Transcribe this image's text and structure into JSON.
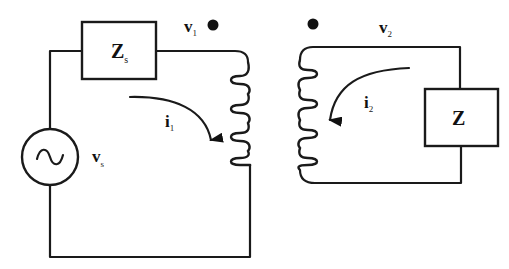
{
  "diagram": {
    "type": "transformer-circuit",
    "primary": {
      "source": {
        "label": "v",
        "subscript": "s",
        "symbol": "~"
      },
      "series_impedance": {
        "label": "Z",
        "subscript": "s"
      },
      "voltage": {
        "label": "v",
        "subscript": "1"
      },
      "current": {
        "label": "i",
        "subscript": "1"
      },
      "coil_turns": 5,
      "dot_marker": true
    },
    "secondary": {
      "load_impedance": {
        "label": "Z",
        "subscript": ""
      },
      "voltage": {
        "label": "v",
        "subscript": "2"
      },
      "current": {
        "label": "i",
        "subscript": "2"
      },
      "coil_turns": 5,
      "dot_marker": true
    },
    "colors": {
      "line": "#1a1a1a",
      "background": "#ffffff"
    }
  }
}
